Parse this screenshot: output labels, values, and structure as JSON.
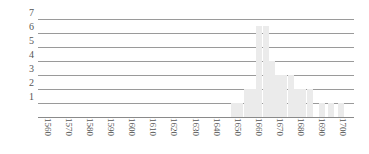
{
  "chart_data": {
    "type": "bar",
    "title": "",
    "subtitle": "",
    "xlabel": "",
    "ylabel": "",
    "grid": true,
    "legend": false,
    "bar_color": "#ebebeb",
    "grid_color": "#9a9a9a",
    "axis_color": "#8a8a8a",
    "ylim": [
      0,
      7.4
    ],
    "yticks": [
      1,
      2,
      3,
      4,
      5,
      6,
      7
    ],
    "ytick_labels": [
      "1",
      "2",
      "3",
      "4",
      "5",
      "6",
      "7"
    ],
    "xlim": [
      1555,
      1705
    ],
    "xticks": [
      1560,
      1570,
      1580,
      1590,
      1600,
      1610,
      1620,
      1630,
      1640,
      1650,
      1660,
      1670,
      1680,
      1690,
      1700
    ],
    "xtick_labels": [
      "1560",
      "1570",
      "1580",
      "1590",
      "1600",
      "1610",
      "1620",
      "1630",
      "1640",
      "1650",
      "1660",
      "1670",
      "1680",
      "1690",
      "1700"
    ],
    "x": [
      1648,
      1651,
      1654,
      1657,
      1660,
      1663,
      1666,
      1669,
      1672,
      1675,
      1678,
      1681,
      1684,
      1690,
      1694,
      1699
    ],
    "values": [
      1,
      1,
      2,
      2,
      6.5,
      6.5,
      4,
      3,
      3,
      3,
      2,
      2,
      2,
      1,
      1,
      1
    ],
    "bars": [
      {
        "x": 1648,
        "value": 1
      },
      {
        "x": 1651,
        "value": 1
      },
      {
        "x": 1654,
        "value": 2
      },
      {
        "x": 1657,
        "value": 2
      },
      {
        "x": 1660,
        "value": 6.5
      },
      {
        "x": 1663,
        "value": 6.5
      },
      {
        "x": 1666,
        "value": 4
      },
      {
        "x": 1669,
        "value": 3
      },
      {
        "x": 1672,
        "value": 3
      },
      {
        "x": 1675,
        "value": 3
      },
      {
        "x": 1678,
        "value": 2
      },
      {
        "x": 1681,
        "value": 2
      },
      {
        "x": 1684,
        "value": 2
      },
      {
        "x": 1690,
        "value": 1
      },
      {
        "x": 1694,
        "value": 1
      },
      {
        "x": 1699,
        "value": 1
      }
    ]
  }
}
